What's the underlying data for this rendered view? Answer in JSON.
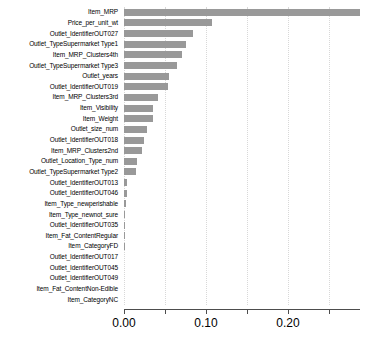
{
  "chart_data": {
    "type": "bar",
    "orientation": "horizontal",
    "title": "",
    "xlabel": "",
    "ylabel": "",
    "xlim": [
      0.0,
      0.2875
    ],
    "grid": true,
    "legend": null,
    "bar_color": "#999999",
    "axis_color": "#4d4d4d",
    "gridline_color": "#d8d8d8",
    "xticks": [
      0.0,
      0.05,
      0.1,
      0.15,
      0.2,
      0.25
    ],
    "xtick_labels": [
      "0.00",
      "",
      "0.10",
      "",
      "0.20",
      ""
    ],
    "categories": [
      "Item_MRP",
      "Price_per_unit_wt",
      "Outlet_IdentifierOUT027",
      "Outlet_TypeSupermarket Type1",
      "Item_MRP_Clusters4th",
      "Outlet_TypeSupermarket Type3",
      "Outlet_years",
      "Outlet_IdentifierOUT019",
      "Item_MRP_Clusters3rd",
      "Item_Visibility",
      "Item_Weight",
      "Outlet_size_num",
      "Outlet_IdentifierOUT018",
      "Item_MRP_Clusters2nd",
      "Outlet_Location_Type_num",
      "Outlet_TypeSupermarket Type2",
      "Outlet_IdentifierOUT013",
      "Outlet_IdentifierOUT046",
      "Item_Type_newperishable",
      "Item_Type_newnot_sure",
      "Outlet_IdentifierOUT035",
      "Item_Fat_ContentRegular",
      "Item_CategoryFD",
      "Outlet_IdentifierOUT017",
      "Outlet_IdentifierOUT045",
      "Outlet_IdentifierOUT049",
      "Item_Fat_ContentNon-Edible",
      "Item_CategoryNC"
    ],
    "values": [
      0.2875,
      0.1073,
      0.0841,
      0.0756,
      0.0707,
      0.0646,
      0.0549,
      0.0537,
      0.0415,
      0.0354,
      0.0354,
      0.0281,
      0.0244,
      0.022,
      0.0159,
      0.0146,
      0.0037,
      0.0037,
      0.0024,
      0.0012,
      0.0012,
      0.0012,
      0.0006,
      0.0,
      0.0,
      0.0,
      0.0,
      0.0
    ]
  }
}
